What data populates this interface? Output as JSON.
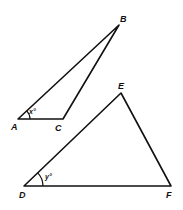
{
  "figure": {
    "triangles": [
      {
        "name": "ABC",
        "vertices": [
          {
            "label": "A",
            "x": 18,
            "y": 119
          },
          {
            "label": "B",
            "x": 119,
            "y": 25
          },
          {
            "label": "C",
            "x": 63,
            "y": 119
          }
        ],
        "angle": {
          "vertex": "A",
          "label": "x°"
        }
      },
      {
        "name": "DEF",
        "vertices": [
          {
            "label": "D",
            "x": 24,
            "y": 186
          },
          {
            "label": "E",
            "x": 121,
            "y": 93
          },
          {
            "label": "F",
            "x": 171,
            "y": 186
          }
        ],
        "angle": {
          "vertex": "D",
          "label": "y°"
        }
      }
    ],
    "labels": {
      "A": "A",
      "B": "B",
      "C": "C",
      "D": "D",
      "E": "E",
      "F": "F",
      "angle_a": "x°",
      "angle_d": "y°"
    },
    "stroke_color": "#111111",
    "background": "#ffffff"
  }
}
